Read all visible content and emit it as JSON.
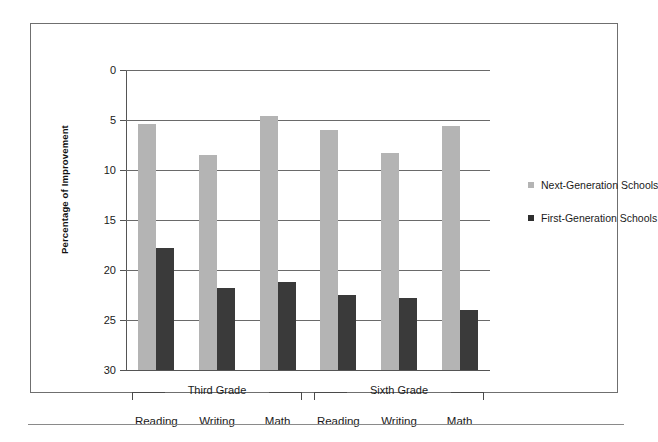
{
  "chart_data": {
    "type": "bar",
    "title": "",
    "xlabel": "",
    "ylabel": "Percentage of Improvement",
    "ylim": [
      0,
      30
    ],
    "yticks": [
      0,
      5,
      10,
      15,
      20,
      25,
      30
    ],
    "ytick_labels": [
      "0",
      "5",
      "10",
      "15",
      "20",
      "25",
      "30"
    ],
    "grid": true,
    "legend_position": "right",
    "groups": [
      "Third Grade",
      "Sixth Grade"
    ],
    "categories": [
      "Reading",
      "Writing",
      "Math",
      "Reading",
      "Writing",
      "Math"
    ],
    "series": [
      {
        "name": "Next-Generation Schools",
        "color": "#b4b4b4",
        "values": [
          24.6,
          21.5,
          25.4,
          24.0,
          21.7,
          24.4
        ]
      },
      {
        "name": "First-Generation Schools",
        "color": "#3a3a3a",
        "values": [
          12.2,
          8.2,
          8.8,
          7.5,
          7.2,
          6.0
        ]
      }
    ]
  },
  "axis": {
    "y_title": "Percentage of Improvement"
  },
  "legend": {
    "items": [
      {
        "label": "Next-Generation Schools",
        "color": "#b4b4b4"
      },
      {
        "label": "First-Generation Schools",
        "color": "#2f2f2f"
      }
    ]
  },
  "groups": [
    {
      "label": "Third Grade"
    },
    {
      "label": "Sixth Grade"
    }
  ],
  "categories": [
    {
      "label": "Reading"
    },
    {
      "label": "Writing"
    },
    {
      "label": "Math"
    },
    {
      "label": "Reading"
    },
    {
      "label": "Writing"
    },
    {
      "label": "Math"
    }
  ],
  "yticks": [
    {
      "label": "30"
    },
    {
      "label": "25"
    },
    {
      "label": "20"
    },
    {
      "label": "15"
    },
    {
      "label": "10"
    },
    {
      "label": "5"
    },
    {
      "label": "0"
    }
  ]
}
